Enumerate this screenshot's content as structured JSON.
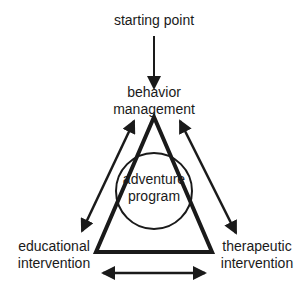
{
  "diagram": {
    "labels": {
      "start": "starting point",
      "top_line1": "behavior",
      "top_line2": "management",
      "center_line1": "adventure",
      "center_line2": "program",
      "left_line1": "educational",
      "left_line2": "intervention",
      "right_line1": "therapeutic",
      "right_line2": "intervention"
    },
    "edges": [
      {
        "from": "starting point",
        "to": "behavior management",
        "type": "one-way arrow"
      },
      {
        "from": "behavior management",
        "to": "educational intervention",
        "type": "two-way arrow"
      },
      {
        "from": "behavior management",
        "to": "therapeutic intervention",
        "type": "two-way arrow"
      },
      {
        "from": "educational intervention",
        "to": "therapeutic intervention",
        "type": "two-way arrow"
      }
    ],
    "colors": {
      "ink": "#1a1a1a",
      "background": "#ffffff"
    }
  }
}
